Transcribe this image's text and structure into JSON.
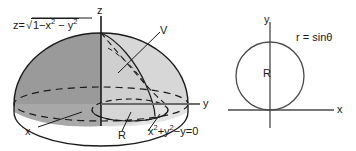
{
  "figure": {
    "width": 356,
    "height": 151,
    "background_color": "#ffffff",
    "stroke_color": "#1a1a1a",
    "panels": [
      {
        "name": "3d-solid-panel",
        "description": "Upper hemisphere of unit sphere with inner solid region V bounded by cylinder x^2+y^2-y=0"
      },
      {
        "name": "2d-polar-panel",
        "description": "Planar region R bounded by the polar circle r = sin theta, tangent to the x-axis at the origin"
      }
    ]
  },
  "solid": {
    "surface_equation": {
      "lhs": "z=",
      "radicand_parts": [
        "1",
        "−x",
        "2",
        " − y",
        "2"
      ],
      "plain": "z = sqrt(1 - x^2 - y^2)"
    },
    "axis_z_label": "z",
    "axis_x_label": "x",
    "axis_y_label": "y",
    "volume_label": "V",
    "base_region_label": "R",
    "base_equation": {
      "parts": [
        "x",
        "2",
        "+y",
        "2",
        "−y=0"
      ],
      "plain": "x^2 + y^2 - y = 0"
    },
    "colors": {
      "shell_dark": "#9a9a9a",
      "shell_light": "#d2d2d2",
      "shell_mid": "#c2c2c2",
      "base_fill": "#e2e2e2",
      "outline": "#1a1a1a"
    }
  },
  "polar": {
    "axis_y_label": "y",
    "axis_x_label": "x",
    "curve_label": "r = sinθ",
    "region_label": "R",
    "circle": {
      "center_x": 270,
      "center_y": 76,
      "radius": 34,
      "tangent_axis": "x"
    },
    "colors": {
      "outline": "#4a4a4a",
      "axis": "#4a4a4a"
    }
  }
}
